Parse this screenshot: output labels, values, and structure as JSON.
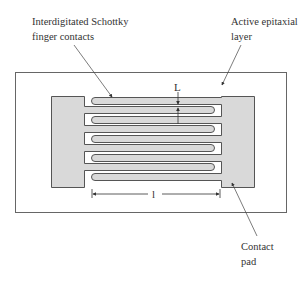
{
  "diagram": {
    "type": "interdigitated MSM photodetector top view",
    "labels": {
      "fingers": [
        "Interdigitated Schottky",
        "finger contacts"
      ],
      "epi": [
        "Active epitaxial",
        "layer"
      ],
      "pad": [
        "Contact",
        "pad"
      ]
    },
    "dimensions": {
      "finger_spacing": "L",
      "finger_length": "l"
    },
    "colors": {
      "pad_fill": "#d9d9d9",
      "outline": "#555555",
      "background": "#ffffff"
    }
  }
}
